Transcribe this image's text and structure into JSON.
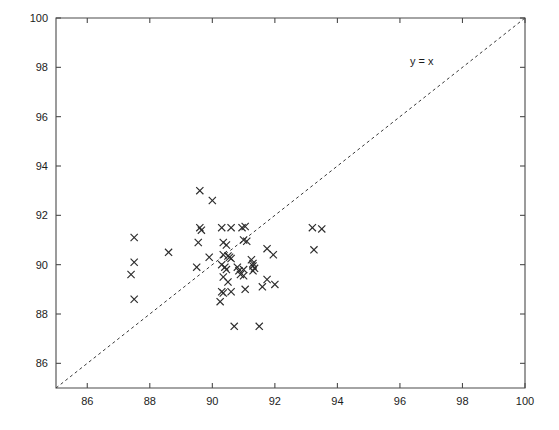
{
  "chart_data": {
    "type": "scatter",
    "title": "",
    "subtitle": "",
    "xlabel": "",
    "ylabel": "",
    "xlim": [
      85,
      100
    ],
    "ylim": [
      85,
      100
    ],
    "grid": false,
    "legend_position": "none",
    "marker": "x",
    "marker_color": "#2b2b2b",
    "x_ticks": [
      86,
      88,
      90,
      92,
      94,
      96,
      98,
      100
    ],
    "y_ticks": [
      86,
      88,
      90,
      92,
      94,
      96,
      98,
      100
    ],
    "x_tick_labels": [
      "86",
      "88",
      "90",
      "92",
      "94",
      "96",
      "98",
      "100"
    ],
    "y_tick_labels": [
      "86",
      "88",
      "90",
      "92",
      "94",
      "96",
      "98",
      "100"
    ],
    "annotations": [
      {
        "text": "y = x",
        "x": 96.7,
        "y": 98.1,
        "name": "identity-line-label"
      }
    ],
    "reference_line": {
      "name": "identity-line",
      "style": "dashed",
      "from": [
        85,
        85
      ],
      "to": [
        100,
        100
      ],
      "label": "y = x"
    },
    "series": [
      {
        "name": "samples",
        "marker": "x",
        "points": [
          [
            87.5,
            91.1
          ],
          [
            87.5,
            90.1
          ],
          [
            87.4,
            89.6
          ],
          [
            87.5,
            88.6
          ],
          [
            89.6,
            93.0
          ],
          [
            90.0,
            92.6
          ],
          [
            89.6,
            91.5
          ],
          [
            89.65,
            91.4
          ],
          [
            90.3,
            91.5
          ],
          [
            90.6,
            91.5
          ],
          [
            90.95,
            91.5
          ],
          [
            91.05,
            91.55
          ],
          [
            89.55,
            90.9
          ],
          [
            90.35,
            90.9
          ],
          [
            90.45,
            90.8
          ],
          [
            91.0,
            91.0
          ],
          [
            91.1,
            90.95
          ],
          [
            88.6,
            90.5
          ],
          [
            89.9,
            90.3
          ],
          [
            90.35,
            90.4
          ],
          [
            90.5,
            90.35
          ],
          [
            90.55,
            90.3
          ],
          [
            90.6,
            90.25
          ],
          [
            91.25,
            90.2
          ],
          [
            91.3,
            90.05
          ],
          [
            91.3,
            89.95
          ],
          [
            91.35,
            89.85
          ],
          [
            91.3,
            89.75
          ],
          [
            91.75,
            90.65
          ],
          [
            91.95,
            90.4
          ],
          [
            89.5,
            89.9
          ],
          [
            90.3,
            90.0
          ],
          [
            90.4,
            89.9
          ],
          [
            90.45,
            89.8
          ],
          [
            90.8,
            89.9
          ],
          [
            90.85,
            89.75
          ],
          [
            91.0,
            89.8
          ],
          [
            90.9,
            89.6
          ],
          [
            91.0,
            89.55
          ],
          [
            90.35,
            89.5
          ],
          [
            90.5,
            89.3
          ],
          [
            91.75,
            89.4
          ],
          [
            90.3,
            88.9
          ],
          [
            90.35,
            88.85
          ],
          [
            90.6,
            88.9
          ],
          [
            91.05,
            89.0
          ],
          [
            90.25,
            88.5
          ],
          [
            91.6,
            89.1
          ],
          [
            93.2,
            91.5
          ],
          [
            93.5,
            91.45
          ],
          [
            93.25,
            90.6
          ],
          [
            92.0,
            89.2
          ],
          [
            90.7,
            87.5
          ],
          [
            91.5,
            87.5
          ]
        ]
      }
    ]
  },
  "figure": {
    "background_color": "#ffffff",
    "axis_color": "#4a4a4a"
  }
}
